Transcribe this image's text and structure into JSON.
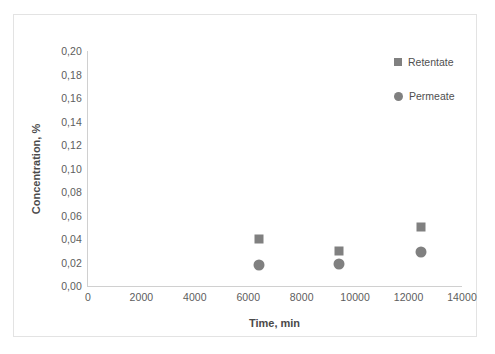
{
  "chart_data": {
    "type": "scatter",
    "title": "",
    "xlabel": "Time, min",
    "ylabel": "Concentration, %",
    "xlim": [
      0,
      14000
    ],
    "ylim": [
      0.0,
      0.2
    ],
    "grid": false,
    "legend_position": "top-right",
    "xticks": [
      0,
      2000,
      4000,
      6000,
      8000,
      10000,
      12000,
      14000
    ],
    "xtick_labels": [
      "0",
      "2000",
      "4000",
      "6000",
      "8000",
      "10000",
      "12000",
      "14000"
    ],
    "yticks": [
      0.0,
      0.02,
      0.04,
      0.06,
      0.08,
      0.1,
      0.12,
      0.14,
      0.16,
      0.18,
      0.2
    ],
    "ytick_labels": [
      "0,00",
      "0,02",
      "0,04",
      "0,06",
      "0,08",
      "0,10",
      "0,12",
      "0,14",
      "0,16",
      "0,18",
      "0,20"
    ],
    "series": [
      {
        "name": "Retentate",
        "marker": "square",
        "color": "#808080",
        "x": [
          6400,
          9400,
          12450
        ],
        "values": [
          0.04,
          0.03,
          0.05
        ]
      },
      {
        "name": "Permeate",
        "marker": "circle",
        "color": "#808080",
        "x": [
          6400,
          9400,
          12450
        ],
        "values": [
          0.018,
          0.019,
          0.029
        ]
      }
    ]
  },
  "legend": {
    "entries": [
      {
        "label": "Retentate",
        "marker": "square"
      },
      {
        "label": "Permeate",
        "marker": "circle"
      }
    ]
  },
  "colors": {
    "marker": "#808080",
    "axis": "#d0d0d0",
    "frame": "#e3e3e3",
    "tick_text": "#5d5d5d",
    "title_text": "#4a4a4a"
  }
}
